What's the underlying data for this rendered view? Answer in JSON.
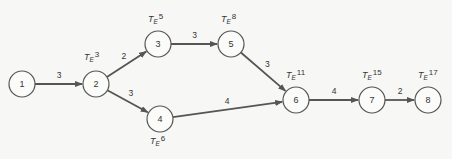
{
  "diagram": {
    "type": "network (PERT/CPM activity-on-arrow)",
    "nodes": [
      {
        "id": "1",
        "label": "1",
        "x": 22,
        "y": 84,
        "te": null
      },
      {
        "id": "2",
        "label": "2",
        "x": 96,
        "y": 84,
        "te": "3"
      },
      {
        "id": "3",
        "label": "3",
        "x": 158,
        "y": 44,
        "te": "5"
      },
      {
        "id": "4",
        "label": "4",
        "x": 160,
        "y": 119,
        "te": "6"
      },
      {
        "id": "5",
        "label": "5",
        "x": 231,
        "y": 44,
        "te": "8"
      },
      {
        "id": "6",
        "label": "6",
        "x": 296,
        "y": 100,
        "te": "11"
      },
      {
        "id": "7",
        "label": "7",
        "x": 372,
        "y": 100,
        "te": "15"
      },
      {
        "id": "8",
        "label": "8",
        "x": 428,
        "y": 100,
        "te": "17"
      }
    ],
    "edges": [
      {
        "from": "1",
        "to": "2",
        "weight": "3"
      },
      {
        "from": "2",
        "to": "3",
        "weight": "2"
      },
      {
        "from": "2",
        "to": "4",
        "weight": "3"
      },
      {
        "from": "3",
        "to": "5",
        "weight": "3"
      },
      {
        "from": "5",
        "to": "6",
        "weight": "3"
      },
      {
        "from": "4",
        "to": "6",
        "weight": "4"
      },
      {
        "from": "6",
        "to": "7",
        "weight": "4"
      },
      {
        "from": "7",
        "to": "8",
        "weight": "2"
      }
    ],
    "te_symbol": "T",
    "te_subscript": "E",
    "te_labels": {
      "n2": "3",
      "n3": "5",
      "n4": "6",
      "n5": "8",
      "n6": "11",
      "n7": "15",
      "n8": "17"
    },
    "colors": {
      "stroke": "#555555",
      "background": "#f7f7f5"
    }
  }
}
